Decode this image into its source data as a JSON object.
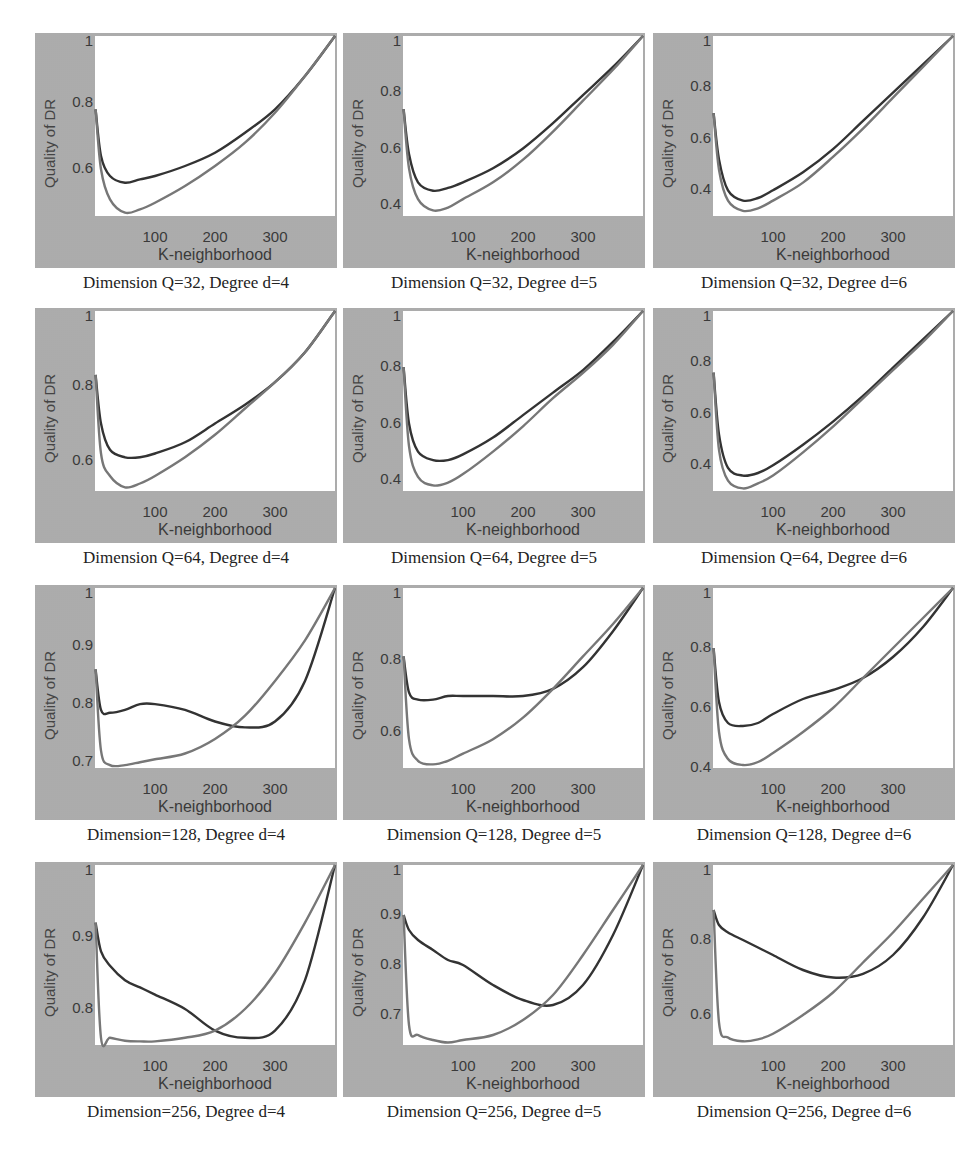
{
  "figure": {
    "ylabel": "Quality of DR",
    "xlabel": "K-neighborhood",
    "xticks": [
      "100",
      "200",
      "300"
    ]
  },
  "panels": [
    {
      "caption": "Dimension Q=32, Degree d=4",
      "yticks": [
        "1",
        "0.8",
        "0.6"
      ]
    },
    {
      "caption": "Dimension Q=32, Degree d=5",
      "yticks": [
        "1",
        "0.8",
        "0.6",
        "0.4"
      ]
    },
    {
      "caption": "Dimension Q=32, Degree d=6",
      "yticks": [
        "1",
        "0.8",
        "0.6",
        "0.4"
      ]
    },
    {
      "caption": "Dimension Q=64, Degree d=4",
      "yticks": [
        "1",
        "0.8",
        "0.6"
      ]
    },
    {
      "caption": "Dimension Q=64, Degree d=5",
      "yticks": [
        "1",
        "0.8",
        "0.6",
        "0.4"
      ]
    },
    {
      "caption": "Dimension Q=64, Degree d=6",
      "yticks": [
        "1",
        "0.8",
        "0.6",
        "0.4"
      ]
    },
    {
      "caption": "Dimension=128, Degree d=4",
      "yticks": [
        "1",
        "0.9",
        "0.8",
        "0.7"
      ]
    },
    {
      "caption": "Dimension Q=128, Degree d=5",
      "yticks": [
        "1",
        "0.8",
        "0.6"
      ]
    },
    {
      "caption": "Dimension Q=128, Degree d=6",
      "yticks": [
        "1",
        "0.8",
        "0.6",
        "0.4"
      ]
    },
    {
      "caption": "Dimension=256, Degree d=4",
      "yticks": [
        "1",
        "0.9",
        "0.8"
      ]
    },
    {
      "caption": "Dimension Q=256, Degree d=5",
      "yticks": [
        "1",
        "0.9",
        "0.8",
        "0.7"
      ]
    },
    {
      "caption": "Dimension Q=256, Degree d=6",
      "yticks": [
        "1",
        "0.8",
        "0.6"
      ]
    }
  ],
  "chart_data": [
    {
      "type": "line",
      "title": "Dimension Q=32, Degree d=4",
      "xlabel": "K-neighborhood",
      "ylabel": "Quality of DR",
      "xlim": [
        0,
        400
      ],
      "ylim": [
        0.46,
        1.0
      ],
      "grid": false,
      "x": [
        1,
        10,
        25,
        50,
        75,
        100,
        150,
        200,
        250,
        300,
        350,
        400
      ],
      "series": [
        {
          "name": "dark",
          "color": "#333333",
          "values": [
            0.78,
            0.64,
            0.58,
            0.56,
            0.57,
            0.58,
            0.61,
            0.65,
            0.71,
            0.78,
            0.88,
            1.0
          ]
        },
        {
          "name": "light",
          "color": "#777777",
          "values": [
            0.78,
            0.6,
            0.51,
            0.47,
            0.48,
            0.5,
            0.55,
            0.61,
            0.68,
            0.77,
            0.88,
            1.0
          ]
        }
      ]
    },
    {
      "type": "line",
      "title": "Dimension Q=32, Degree d=5",
      "xlabel": "K-neighborhood",
      "ylabel": "Quality of DR",
      "xlim": [
        0,
        400
      ],
      "ylim": [
        0.36,
        1.0
      ],
      "grid": false,
      "x": [
        1,
        10,
        25,
        50,
        75,
        100,
        150,
        200,
        250,
        300,
        350,
        400
      ],
      "series": [
        {
          "name": "dark",
          "color": "#333333",
          "values": [
            0.74,
            0.58,
            0.48,
            0.45,
            0.46,
            0.48,
            0.53,
            0.6,
            0.69,
            0.79,
            0.89,
            1.0
          ]
        },
        {
          "name": "light",
          "color": "#777777",
          "values": [
            0.74,
            0.53,
            0.42,
            0.38,
            0.39,
            0.42,
            0.48,
            0.56,
            0.66,
            0.77,
            0.88,
            1.0
          ]
        }
      ]
    },
    {
      "type": "line",
      "title": "Dimension Q=32, Degree d=6",
      "xlabel": "K-neighborhood",
      "ylabel": "Quality of DR",
      "xlim": [
        0,
        400
      ],
      "ylim": [
        0.3,
        1.0
      ],
      "grid": false,
      "x": [
        1,
        10,
        25,
        50,
        75,
        100,
        150,
        200,
        250,
        300,
        350,
        400
      ],
      "series": [
        {
          "name": "dark",
          "color": "#333333",
          "values": [
            0.7,
            0.52,
            0.4,
            0.36,
            0.37,
            0.4,
            0.47,
            0.56,
            0.67,
            0.78,
            0.89,
            1.0
          ]
        },
        {
          "name": "light",
          "color": "#777777",
          "values": [
            0.7,
            0.48,
            0.36,
            0.32,
            0.33,
            0.36,
            0.43,
            0.53,
            0.64,
            0.76,
            0.88,
            1.0
          ]
        }
      ]
    },
    {
      "type": "line",
      "title": "Dimension Q=64, Degree d=4",
      "xlabel": "K-neighborhood",
      "ylabel": "Quality of DR",
      "xlim": [
        0,
        400
      ],
      "ylim": [
        0.52,
        1.0
      ],
      "grid": false,
      "x": [
        1,
        10,
        25,
        50,
        75,
        100,
        150,
        200,
        250,
        300,
        350,
        400
      ],
      "series": [
        {
          "name": "dark",
          "color": "#333333",
          "values": [
            0.83,
            0.7,
            0.63,
            0.61,
            0.61,
            0.62,
            0.65,
            0.7,
            0.75,
            0.81,
            0.89,
            1.0
          ]
        },
        {
          "name": "light",
          "color": "#777777",
          "values": [
            0.83,
            0.62,
            0.56,
            0.53,
            0.54,
            0.56,
            0.61,
            0.67,
            0.74,
            0.81,
            0.89,
            1.0
          ]
        }
      ]
    },
    {
      "type": "line",
      "title": "Dimension Q=64, Degree d=5",
      "xlabel": "K-neighborhood",
      "ylabel": "Quality of DR",
      "xlim": [
        0,
        400
      ],
      "ylim": [
        0.36,
        1.0
      ],
      "grid": false,
      "x": [
        1,
        10,
        25,
        50,
        75,
        100,
        150,
        200,
        250,
        300,
        350,
        400
      ],
      "series": [
        {
          "name": "dark",
          "color": "#333333",
          "values": [
            0.8,
            0.6,
            0.5,
            0.47,
            0.47,
            0.49,
            0.55,
            0.63,
            0.71,
            0.79,
            0.89,
            1.0
          ]
        },
        {
          "name": "light",
          "color": "#777777",
          "values": [
            0.8,
            0.52,
            0.41,
            0.38,
            0.39,
            0.42,
            0.5,
            0.59,
            0.69,
            0.78,
            0.88,
            1.0
          ]
        }
      ]
    },
    {
      "type": "line",
      "title": "Dimension Q=64, Degree d=6",
      "xlabel": "K-neighborhood",
      "ylabel": "Quality of DR",
      "xlim": [
        0,
        400
      ],
      "ylim": [
        0.3,
        1.0
      ],
      "grid": false,
      "x": [
        1,
        10,
        25,
        50,
        75,
        100,
        150,
        200,
        250,
        300,
        350,
        400
      ],
      "series": [
        {
          "name": "dark",
          "color": "#333333",
          "values": [
            0.76,
            0.52,
            0.39,
            0.36,
            0.37,
            0.4,
            0.48,
            0.57,
            0.67,
            0.78,
            0.89,
            1.0
          ]
        },
        {
          "name": "light",
          "color": "#777777",
          "values": [
            0.76,
            0.46,
            0.34,
            0.31,
            0.33,
            0.36,
            0.45,
            0.55,
            0.66,
            0.77,
            0.88,
            1.0
          ]
        }
      ]
    },
    {
      "type": "line",
      "title": "Dimension=128, Degree d=4",
      "xlabel": "K-neighborhood",
      "ylabel": "Quality of DR",
      "xlim": [
        0,
        400
      ],
      "ylim": [
        0.69,
        1.0
      ],
      "grid": false,
      "x": [
        1,
        10,
        25,
        50,
        75,
        100,
        150,
        200,
        250,
        300,
        350,
        400
      ],
      "series": [
        {
          "name": "dark",
          "color": "#333333",
          "values": [
            0.86,
            0.79,
            0.785,
            0.79,
            0.8,
            0.8,
            0.79,
            0.77,
            0.76,
            0.77,
            0.84,
            1.0
          ]
        },
        {
          "name": "light",
          "color": "#777777",
          "values": [
            0.86,
            0.72,
            0.695,
            0.695,
            0.7,
            0.705,
            0.715,
            0.74,
            0.78,
            0.84,
            0.91,
            1.0
          ]
        }
      ]
    },
    {
      "type": "line",
      "title": "Dimension Q=128, Degree d=5",
      "xlabel": "K-neighborhood",
      "ylabel": "Quality of DR",
      "xlim": [
        0,
        400
      ],
      "ylim": [
        0.5,
        1.0
      ],
      "grid": false,
      "x": [
        1,
        10,
        25,
        50,
        75,
        100,
        150,
        200,
        250,
        300,
        350,
        400
      ],
      "series": [
        {
          "name": "dark",
          "color": "#333333",
          "values": [
            0.81,
            0.71,
            0.69,
            0.69,
            0.7,
            0.7,
            0.7,
            0.7,
            0.72,
            0.78,
            0.88,
            1.0
          ]
        },
        {
          "name": "light",
          "color": "#777777",
          "values": [
            0.81,
            0.58,
            0.52,
            0.51,
            0.52,
            0.54,
            0.58,
            0.64,
            0.72,
            0.81,
            0.9,
            1.0
          ]
        }
      ]
    },
    {
      "type": "line",
      "title": "Dimension Q=128, Degree d=6",
      "xlabel": "K-neighborhood",
      "ylabel": "Quality of DR",
      "xlim": [
        0,
        400
      ],
      "ylim": [
        0.4,
        1.0
      ],
      "grid": false,
      "x": [
        1,
        10,
        25,
        50,
        75,
        100,
        150,
        200,
        250,
        300,
        350,
        400
      ],
      "series": [
        {
          "name": "dark",
          "color": "#333333",
          "values": [
            0.8,
            0.62,
            0.55,
            0.54,
            0.55,
            0.58,
            0.63,
            0.66,
            0.7,
            0.77,
            0.87,
            1.0
          ]
        },
        {
          "name": "light",
          "color": "#777777",
          "values": [
            0.8,
            0.52,
            0.43,
            0.41,
            0.42,
            0.45,
            0.52,
            0.6,
            0.7,
            0.8,
            0.9,
            1.0
          ]
        }
      ]
    },
    {
      "type": "line",
      "title": "Dimension=256, Degree d=4",
      "xlabel": "K-neighborhood",
      "ylabel": "Quality of DR",
      "xlim": [
        0,
        400
      ],
      "ylim": [
        0.75,
        1.0
      ],
      "grid": false,
      "x": [
        1,
        10,
        25,
        50,
        75,
        100,
        150,
        200,
        250,
        300,
        350,
        400
      ],
      "series": [
        {
          "name": "dark",
          "color": "#333333",
          "values": [
            0.92,
            0.88,
            0.86,
            0.84,
            0.83,
            0.82,
            0.8,
            0.77,
            0.76,
            0.77,
            0.84,
            1.0
          ]
        },
        {
          "name": "light",
          "color": "#777777",
          "values": [
            0.92,
            0.76,
            0.76,
            0.756,
            0.755,
            0.755,
            0.76,
            0.77,
            0.8,
            0.85,
            0.92,
            1.0
          ]
        }
      ]
    },
    {
      "type": "line",
      "title": "Dimension Q=256, Degree d=5",
      "xlabel": "K-neighborhood",
      "ylabel": "Quality of DR",
      "xlim": [
        0,
        400
      ],
      "ylim": [
        0.64,
        1.0
      ],
      "grid": false,
      "x": [
        1,
        10,
        25,
        50,
        75,
        100,
        150,
        200,
        250,
        300,
        350,
        400
      ],
      "series": [
        {
          "name": "dark",
          "color": "#333333",
          "values": [
            0.9,
            0.87,
            0.85,
            0.83,
            0.81,
            0.8,
            0.76,
            0.73,
            0.72,
            0.76,
            0.86,
            1.0
          ]
        },
        {
          "name": "light",
          "color": "#777777",
          "values": [
            0.9,
            0.68,
            0.66,
            0.65,
            0.645,
            0.65,
            0.66,
            0.69,
            0.74,
            0.82,
            0.91,
            1.0
          ]
        }
      ]
    },
    {
      "type": "line",
      "title": "Dimension Q=256, Degree d=6",
      "xlabel": "K-neighborhood",
      "ylabel": "Quality of DR",
      "xlim": [
        0,
        400
      ],
      "ylim": [
        0.52,
        1.0
      ],
      "grid": false,
      "x": [
        1,
        10,
        25,
        50,
        75,
        100,
        150,
        200,
        250,
        300,
        350,
        400
      ],
      "series": [
        {
          "name": "dark",
          "color": "#333333",
          "values": [
            0.88,
            0.84,
            0.82,
            0.8,
            0.78,
            0.76,
            0.72,
            0.7,
            0.71,
            0.76,
            0.86,
            1.0
          ]
        },
        {
          "name": "light",
          "color": "#777777",
          "values": [
            0.88,
            0.58,
            0.54,
            0.53,
            0.535,
            0.55,
            0.6,
            0.66,
            0.74,
            0.82,
            0.91,
            1.0
          ]
        }
      ]
    }
  ]
}
